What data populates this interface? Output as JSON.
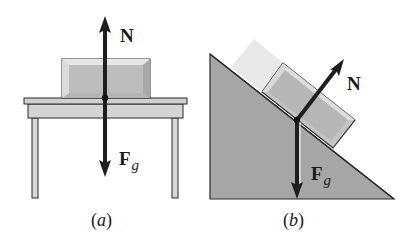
{
  "figure": {
    "panel_a": {
      "caption_open": "(",
      "caption_letter": "a",
      "caption_close": ")",
      "normal_force_label": "N",
      "gravity_label_main": "F",
      "gravity_label_sub": "g",
      "description": "Block resting on a horizontal table"
    },
    "panel_b": {
      "caption_open": "(",
      "caption_letter": "b",
      "caption_close": ")",
      "normal_force_label": "N",
      "gravity_label_main": "F",
      "gravity_label_sub": "g",
      "description": "Block resting on an inclined plane"
    },
    "colors": {
      "arrow": "#1e1e1e",
      "block_fill": "#c8c8c8",
      "block_inner": "#b8b8b8",
      "table_fill": "#d4d4d4",
      "incline_fill": "#a6a6a6",
      "ghost_block": "#e4e4e4",
      "outline": "#2a2a2a"
    }
  }
}
